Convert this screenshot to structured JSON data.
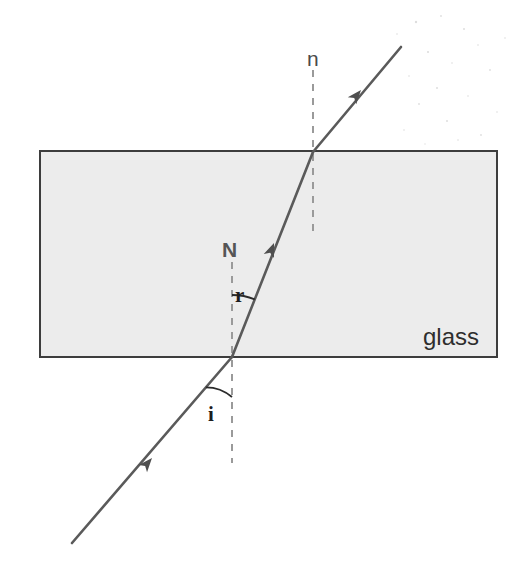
{
  "figure": {
    "width": 522,
    "height": 583,
    "background_color": "#ffffff"
  },
  "colors": {
    "glass_fill": "#ececec",
    "glass_border": "#3d3d3d",
    "ray_stroke": "#5a5a5a",
    "normal_dash": "#9a9a9a",
    "arc_stroke": "#2a2a2a",
    "text_dark": "#1d1d1d",
    "text_gray": "#4a4a4a",
    "speckle": "#dedede"
  },
  "glass_block": {
    "label": "glass",
    "label_x": 423,
    "label_y": 325,
    "x": 40,
    "y": 151,
    "width": 457,
    "height": 206
  },
  "labels": {
    "normal_top": "n",
    "normal_bottom": "N",
    "angle_incidence": "i",
    "angle_refraction": "r",
    "material": "glass"
  },
  "label_positions": {
    "normal_top": {
      "x": 307,
      "y": 48
    },
    "normal_bottom": {
      "x": 222,
      "y": 239
    },
    "angle_refraction": {
      "x": 235,
      "y": 285
    },
    "angle_incidence": {
      "x": 208,
      "y": 404
    }
  },
  "geometry": {
    "entry_point": {
      "x": 232,
      "y": 357
    },
    "exit_point": {
      "x": 313,
      "y": 152
    },
    "incident_ray": {
      "x1": 72,
      "y1": 543,
      "x2": 232,
      "y2": 357
    },
    "refracted_ray": {
      "x1": 232,
      "y1": 357,
      "x2": 313,
      "y2": 152
    },
    "emergent_ray": {
      "x1": 313,
      "y1": 152,
      "x2": 401,
      "y2": 47
    },
    "normal_lower": {
      "x": 232,
      "y1": 262,
      "y2": 463
    },
    "normal_upper": {
      "x": 313,
      "y1": 70,
      "y2": 233
    },
    "arrow_incident": {
      "x": 152,
      "y": 458
    },
    "arrow_refracted": {
      "x": 274,
      "y": 243
    },
    "arrow_emergent": {
      "x": 361,
      "y": 90
    }
  },
  "chart_data": {
    "type": "diagram",
    "elements": [
      {
        "name": "incident-ray",
        "role": "light ray in air approaching the glass",
        "angle_label": "i"
      },
      {
        "name": "refracted-ray",
        "role": "light ray bent inside the glass",
        "angle_label": "r"
      },
      {
        "name": "emergent-ray",
        "role": "light ray leaving the glass, parallel to incident ray"
      },
      {
        "name": "normal-lower",
        "role": "normal to the lower surface",
        "label": "N"
      },
      {
        "name": "normal-upper",
        "role": "normal to the upper surface",
        "label": "n"
      },
      {
        "name": "glass-block",
        "role": "rectangular refracting medium",
        "label": "glass"
      }
    ],
    "annotations": [
      "n",
      "N",
      "r",
      "i",
      "glass"
    ]
  },
  "speckles": [
    {
      "x": 416,
      "y": 22,
      "r": 1.2
    },
    {
      "x": 441,
      "y": 16,
      "r": 0.9
    },
    {
      "x": 397,
      "y": 34,
      "r": 0.8
    },
    {
      "x": 464,
      "y": 29,
      "r": 1.0
    },
    {
      "x": 478,
      "y": 45,
      "r": 0.8
    },
    {
      "x": 428,
      "y": 52,
      "r": 1.1
    },
    {
      "x": 452,
      "y": 63,
      "r": 0.8
    },
    {
      "x": 490,
      "y": 70,
      "r": 0.9
    },
    {
      "x": 409,
      "y": 76,
      "r": 0.8
    },
    {
      "x": 437,
      "y": 88,
      "r": 1.0
    },
    {
      "x": 468,
      "y": 96,
      "r": 0.8
    },
    {
      "x": 419,
      "y": 104,
      "r": 0.9
    },
    {
      "x": 497,
      "y": 112,
      "r": 0.8
    },
    {
      "x": 447,
      "y": 121,
      "r": 1.0
    },
    {
      "x": 404,
      "y": 130,
      "r": 0.8
    },
    {
      "x": 481,
      "y": 135,
      "r": 0.9
    },
    {
      "x": 390,
      "y": 60,
      "r": 0.8
    },
    {
      "x": 505,
      "y": 38,
      "r": 0.8
    },
    {
      "x": 458,
      "y": 140,
      "r": 0.8
    },
    {
      "x": 425,
      "y": 144,
      "r": 0.7
    }
  ]
}
